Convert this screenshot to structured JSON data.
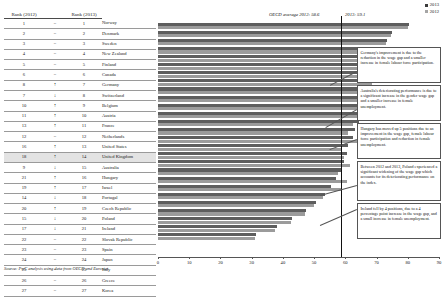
{
  "table": {
    "headers": {
      "rank_2012": "Rank (2012)",
      "arrow": "",
      "rank_2013": "Rank (2013)",
      "country": ""
    },
    "rows": [
      {
        "rank2012": "1",
        "arrow": "=",
        "rank2013": "1",
        "country": "Norway",
        "hl": false
      },
      {
        "rank2012": "2",
        "arrow": "=",
        "rank2013": "2",
        "country": "Denmark",
        "hl": false
      },
      {
        "rank2012": "3",
        "arrow": "=",
        "rank2013": "3",
        "country": "Sweden",
        "hl": false
      },
      {
        "rank2012": "4",
        "arrow": "=",
        "rank2013": "4",
        "country": "New Zealand",
        "hl": false
      },
      {
        "rank2012": "5",
        "arrow": "=",
        "rank2013": "5",
        "country": "Finland",
        "hl": false
      },
      {
        "rank2012": "6",
        "arrow": "=",
        "rank2013": "6",
        "country": "Canada",
        "hl": false
      },
      {
        "rank2012": "8",
        "arrow": "↑",
        "rank2013": "7",
        "country": "Germany",
        "hl": false
      },
      {
        "rank2012": "7",
        "arrow": "↓",
        "rank2013": "8",
        "country": "Switzerland",
        "hl": false
      },
      {
        "rank2012": "10",
        "arrow": "↑",
        "rank2013": "9",
        "country": "Belgium",
        "hl": false
      },
      {
        "rank2012": "11",
        "arrow": "↑",
        "rank2013": "10",
        "country": "Austria",
        "hl": false
      },
      {
        "rank2012": "13",
        "arrow": "↑",
        "rank2013": "11",
        "country": "France",
        "hl": false
      },
      {
        "rank2012": "12",
        "arrow": "=",
        "rank2013": "12",
        "country": "Netherlands",
        "hl": false
      },
      {
        "rank2012": "16",
        "arrow": "↑",
        "rank2013": "13",
        "country": "United States",
        "hl": false
      },
      {
        "rank2012": "18",
        "arrow": "↑",
        "rank2013": "14",
        "country": "United Kingdom",
        "hl": true
      },
      {
        "rank2012": "9",
        "arrow": "↓",
        "rank2013": "15",
        "country": "Australia",
        "hl": false
      },
      {
        "rank2012": "21",
        "arrow": "↑",
        "rank2013": "16",
        "country": "Hungary",
        "hl": false
      },
      {
        "rank2012": "19",
        "arrow": "↑",
        "rank2013": "17",
        "country": "Israel",
        "hl": false
      },
      {
        "rank2012": "14",
        "arrow": "↓",
        "rank2013": "18",
        "country": "Portugal",
        "hl": false
      },
      {
        "rank2012": "20",
        "arrow": "↑",
        "rank2013": "19",
        "country": "Czech Republic",
        "hl": false
      },
      {
        "rank2012": "15",
        "arrow": "↓",
        "rank2013": "20",
        "country": "Poland",
        "hl": false
      },
      {
        "rank2012": "17",
        "arrow": "↓",
        "rank2013": "21",
        "country": "Ireland",
        "hl": false
      },
      {
        "rank2012": "22",
        "arrow": "=",
        "rank2013": "22",
        "country": "Slovak Republic",
        "hl": false
      },
      {
        "rank2012": "23",
        "arrow": "=",
        "rank2013": "23",
        "country": "Spain",
        "hl": false
      },
      {
        "rank2012": "24",
        "arrow": "=",
        "rank2013": "24",
        "country": "Japan",
        "hl": false
      },
      {
        "rank2012": "25",
        "arrow": "=",
        "rank2013": "25",
        "country": "Italy",
        "hl": false
      },
      {
        "rank2012": "26",
        "arrow": "=",
        "rank2013": "26",
        "country": "Greece",
        "hl": false
      },
      {
        "rank2012": "27",
        "arrow": "=",
        "rank2013": "27",
        "country": "Korea",
        "hl": false
      }
    ]
  },
  "source": "Source: PwC analysis using data from OECD and Eurostat",
  "legend": {
    "items": [
      {
        "label": "2013",
        "color": "#3b3b3b"
      },
      {
        "label": "2012",
        "color": "#a5a5a5"
      }
    ]
  },
  "annotations": {
    "oecd_avg_2012": "OECD average 2012: 58.6",
    "oecd_avg_2013": "2013: 59.1"
  },
  "notes": [
    {
      "id": "germany-note",
      "text": "Germany's improvement is due to the reduction in the wage gap and a smaller increase in female labour force participation."
    },
    {
      "id": "australia-note",
      "text": "Australia's deteriorating performance is due to a significant increase in the gender wage gap and a smaller increase in female unemployment."
    },
    {
      "id": "hungary-note",
      "text": "Hungary has moved up 5 positions due to an improvement in the wage gap, female labour force participation and reduction in female unemployment."
    },
    {
      "id": "poland-note",
      "text": "Between 2012 and 2013, Poland experienced a significant widening of the wage gap which accounts for its deteriorating performance on the index."
    },
    {
      "id": "ireland-note",
      "text": "Ireland fell by 4 positions, due to a 4 percentage point increase in the wage gap, and a small increase in female unemployment."
    }
  ],
  "chart_data": {
    "type": "bar",
    "orientation": "horizontal",
    "title": "",
    "xlabel": "",
    "ylabel": "",
    "xlim": [
      0,
      90
    ],
    "xticks": [
      0,
      10,
      20,
      30,
      40,
      50,
      60,
      70,
      80,
      90
    ],
    "grid": false,
    "legend_position": "top-right",
    "categories": [
      "Norway",
      "Denmark",
      "Sweden",
      "New Zealand",
      "Finland",
      "Canada",
      "Germany",
      "Switzerland",
      "Belgium",
      "Austria",
      "France",
      "Netherlands",
      "United States",
      "United Kingdom",
      "Australia",
      "Hungary",
      "Israel",
      "Portugal",
      "Czech Republic",
      "Poland",
      "Ireland",
      "Slovak Republic",
      "Spain",
      "Japan",
      "Italy",
      "Greece",
      "Korea"
    ],
    "series": [
      {
        "name": "2013",
        "color": "#5e5e5e",
        "values": [
          80.5,
          75.0,
          73.5,
          72.0,
          71.5,
          70.5,
          69.0,
          68.5,
          67.5,
          67.0,
          66.5,
          66.0,
          64.5,
          63.0,
          62.5,
          61.0,
          60.5,
          59.5,
          58.5,
          57.0,
          55.5,
          53.5,
          50.5,
          47.5,
          43.0,
          38.0,
          31.5
        ]
      },
      {
        "name": "2012",
        "color": "#9b9b9b",
        "values": [
          80.0,
          74.5,
          73.0,
          71.5,
          71.0,
          70.0,
          67.5,
          68.5,
          66.5,
          66.0,
          65.0,
          66.0,
          62.5,
          61.0,
          67.5,
          58.5,
          59.5,
          61.5,
          57.5,
          60.5,
          59.0,
          53.0,
          50.0,
          47.0,
          42.5,
          37.5,
          31.0
        ]
      }
    ],
    "reference_lines": [
      {
        "label": "OECD average 2012: 58.6",
        "value": 58.6
      },
      {
        "label": "2013: 59.1",
        "value": 59.1
      }
    ]
  }
}
